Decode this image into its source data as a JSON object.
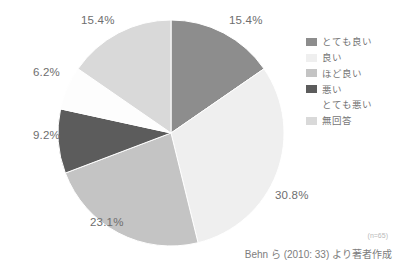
{
  "chart_data": {
    "type": "pie",
    "title": "",
    "labels": [
      "とても良い",
      "良い",
      "ほど良い",
      "悪い",
      "とても悪い",
      "無回答"
    ],
    "values": [
      15.4,
      30.8,
      23.1,
      9.2,
      6.2,
      15.4
    ],
    "value_labels": [
      "15.4%",
      "30.8%",
      "23.1%",
      "9.2%",
      "6.2%",
      "15.4%"
    ],
    "colors": [
      "#8d8d8d",
      "#efefef",
      "#c4c4c4",
      "#5c5c5c",
      "#fdfdfd",
      "#d9d9d9"
    ],
    "start_angle_deg": 0,
    "direction": "clockwise",
    "legend_position": "right",
    "grid": false,
    "units": "percent",
    "sample_size": "(n=65)",
    "source": "Behn ら (2010: 33) より著者作成"
  },
  "legend": {
    "items": [
      {
        "label": "とても良い",
        "color": "#8d8d8d"
      },
      {
        "label": "良い",
        "color": "#efefef"
      },
      {
        "label": "ほど良い",
        "color": "#c4c4c4"
      },
      {
        "label": "悪い",
        "color": "#5c5c5c"
      },
      {
        "label": "とても悪い",
        "color": "#fdfdfd"
      },
      {
        "label": "無回答",
        "color": "#d9d9d9"
      }
    ]
  },
  "labels": {
    "top_right": "15.4%",
    "right": "30.8%",
    "bottom": "23.1%",
    "left_lower": "9.2%",
    "left_upper": "6.2%",
    "top_left": "15.4%"
  },
  "footer": {
    "sample_size": "(n=65)",
    "source": "Behn ら (2010: 33) より著者作成"
  }
}
